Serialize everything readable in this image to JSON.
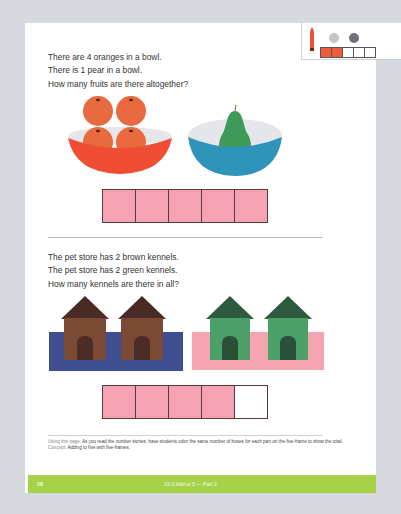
{
  "legend": {
    "crayon_color": "#e8533c",
    "dots": [
      "light-gray-counter",
      "dark-gray-counter"
    ],
    "mini_frame": {
      "cells": 5,
      "filled": 2
    }
  },
  "problem1": {
    "lines": [
      "There are 4 oranges in a bowl.",
      "There is 1 pear in a bowl.",
      "How many fruits are there altogether?"
    ],
    "group_a": {
      "item": "orange",
      "count": 4,
      "bowl_color": "#ef5a3c"
    },
    "group_b": {
      "item": "pear",
      "count": 1,
      "bowl_color": "#2f94b9"
    },
    "five_frame": {
      "cells": 5,
      "filled": 5,
      "fill_color": "#f4a2b4"
    }
  },
  "problem2": {
    "lines": [
      "The pet store has 2 brown kennels.",
      "The pet store has 2 green kennels.",
      "How many kennels are there in all?"
    ],
    "group_a": {
      "item": "brown kennel",
      "count": 2,
      "mat_color": "#3f4d91"
    },
    "group_b": {
      "item": "green kennel",
      "count": 2,
      "mat_color": "#f6a5b0"
    },
    "five_frame": {
      "cells": 5,
      "filled": 4,
      "fill_color": "#f4a2b4"
    }
  },
  "note": {
    "lead": "Using this page:",
    "text": "As you read the number stories, have students color the same number of boxes for each part on the five-frame to show the total.",
    "concept_lead": "Concept:",
    "concept": "Adding to five with five-frames."
  },
  "footer": {
    "page_number": "58",
    "title": "10-2 Add to 5 — Part 2",
    "color": "#a8d14a"
  }
}
